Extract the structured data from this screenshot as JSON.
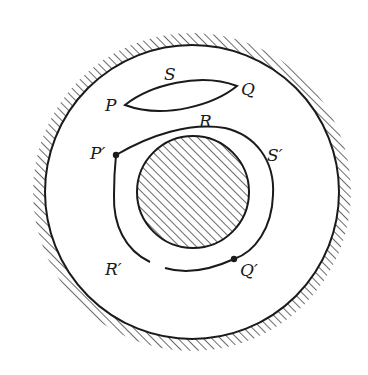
{
  "diagram": {
    "type": "physics-flow-region",
    "labels": {
      "P": "P",
      "Q": "Q",
      "R": "R",
      "S": "S",
      "P_prime": "P′",
      "Q_prime": "Q′",
      "R_prime": "R′",
      "S_prime": "S′"
    },
    "colors": {
      "ink": "#1a1a1a",
      "background": "#ffffff"
    },
    "elements": [
      "outer circular boundary with external hatching",
      "inner hatched circular obstacle",
      "lens-shaped curve P-S-Q-R",
      "closed curve P'-S'-Q'-R' surrounding the obstacle with dots at P' and Q'"
    ]
  }
}
